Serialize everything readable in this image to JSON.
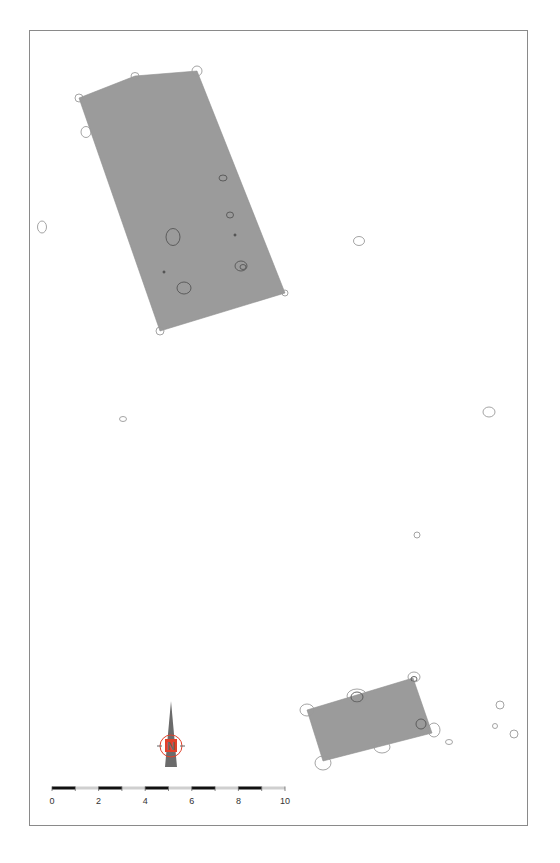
{
  "map": {
    "frame": {
      "x": 29,
      "y": 30,
      "width": 499,
      "height": 796
    },
    "colors": {
      "polygon_fill": "#9b9b9b",
      "feature_stroke": "#555555",
      "outer_circle_stroke": "#9a9a9a",
      "frame_border": "#8a8a8a",
      "north_arrow_body": "#6b6b6b",
      "north_arrow_badge": "#e0402a",
      "scale_dark": "#111111",
      "scale_light": "#cfcfcf"
    },
    "polygons": [
      {
        "name": "excavation-area-north",
        "points": [
          [
            79,
            98
          ],
          [
            135,
            76
          ],
          [
            197,
            71
          ],
          [
            285,
            293
          ],
          [
            160,
            331
          ]
        ]
      },
      {
        "name": "excavation-area-south",
        "points": [
          [
            307,
            710
          ],
          [
            413,
            678
          ],
          [
            432,
            733
          ],
          [
            323,
            761
          ]
        ]
      }
    ],
    "features_inside": [
      {
        "cx": 223,
        "cy": 178,
        "rx": 4,
        "ry": 3
      },
      {
        "cx": 230,
        "cy": 215,
        "rx": 3.5,
        "ry": 3
      },
      {
        "cx": 173,
        "cy": 237,
        "rx": 7,
        "ry": 8.5
      },
      {
        "cx": 235,
        "cy": 235,
        "rx": 1.2,
        "ry": 1.2
      },
      {
        "cx": 241,
        "cy": 266,
        "rx": 6,
        "ry": 5
      },
      {
        "cx": 243,
        "cy": 267,
        "rx": 3,
        "ry": 2.5
      },
      {
        "cx": 164,
        "cy": 272,
        "rx": 1.2,
        "ry": 1.2
      },
      {
        "cx": 184,
        "cy": 288,
        "rx": 7,
        "ry": 6
      },
      {
        "cx": 357,
        "cy": 697,
        "rx": 6,
        "ry": 5
      },
      {
        "cx": 421,
        "cy": 724,
        "rx": 5,
        "ry": 5
      },
      {
        "cx": 414,
        "cy": 679,
        "rx": 3,
        "ry": 2.5
      }
    ],
    "features_outline": [
      {
        "cx": 79,
        "cy": 98,
        "rx": 4,
        "ry": 4
      },
      {
        "cx": 135,
        "cy": 76,
        "rx": 4,
        "ry": 3.5
      },
      {
        "cx": 197,
        "cy": 71,
        "rx": 5,
        "ry": 5
      },
      {
        "cx": 86,
        "cy": 132,
        "rx": 5,
        "ry": 5.5
      },
      {
        "cx": 285,
        "cy": 293,
        "rx": 3,
        "ry": 3
      },
      {
        "cx": 160,
        "cy": 331,
        "rx": 4,
        "ry": 4
      },
      {
        "cx": 42,
        "cy": 227,
        "rx": 4.5,
        "ry": 6
      },
      {
        "cx": 359,
        "cy": 241,
        "rx": 5.5,
        "ry": 4.5
      },
      {
        "cx": 123,
        "cy": 419,
        "rx": 3.5,
        "ry": 2.5
      },
      {
        "cx": 489,
        "cy": 412,
        "rx": 6,
        "ry": 5
      },
      {
        "cx": 417,
        "cy": 535,
        "rx": 3,
        "ry": 3
      },
      {
        "cx": 307,
        "cy": 710,
        "rx": 7,
        "ry": 6
      },
      {
        "cx": 357,
        "cy": 696,
        "rx": 10,
        "ry": 7
      },
      {
        "cx": 414,
        "cy": 677,
        "rx": 6,
        "ry": 5
      },
      {
        "cx": 434,
        "cy": 730,
        "rx": 6,
        "ry": 7
      },
      {
        "cx": 382,
        "cy": 747,
        "rx": 8,
        "ry": 6
      },
      {
        "cx": 323,
        "cy": 763,
        "rx": 8,
        "ry": 7
      },
      {
        "cx": 449,
        "cy": 742,
        "rx": 3.5,
        "ry": 2.5
      },
      {
        "cx": 500,
        "cy": 705,
        "rx": 4,
        "ry": 4
      },
      {
        "cx": 495,
        "cy": 726,
        "rx": 2.5,
        "ry": 2.5
      },
      {
        "cx": 514,
        "cy": 734,
        "rx": 4,
        "ry": 4
      }
    ],
    "north_arrow": {
      "letter": "N",
      "x": 171,
      "tip_y": 701,
      "base_y": 767,
      "circle_cy": 746,
      "circle_r": 11
    },
    "scale_bar": {
      "x_start": 52,
      "x_end": 285,
      "y": 788,
      "segments": 10,
      "labels": [
        "0",
        "2",
        "4",
        "6",
        "8",
        "10"
      ]
    }
  }
}
